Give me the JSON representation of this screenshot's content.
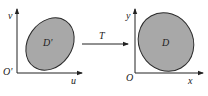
{
  "diagram": {
    "type": "coordinate-transformation",
    "source_plane": {
      "origin_label": "O'",
      "horizontal_axis_label": "u",
      "vertical_axis_label": "v",
      "region_label": "D'"
    },
    "transformation": {
      "label": "T"
    },
    "target_plane": {
      "origin_label": "O",
      "horizontal_axis_label": "x",
      "vertical_axis_label": "y",
      "region_label": "D"
    },
    "colors": {
      "region_fill": "#a8a8a8",
      "region_stroke": "#2a2a2a",
      "axis": "#222222",
      "background": "#ffffff"
    }
  }
}
